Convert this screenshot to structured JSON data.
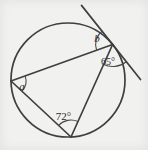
{
  "figure": {
    "labels": {
      "a": "a",
      "b": "b",
      "tangent_chord_angle": "65°",
      "inscribed_angle": "72°"
    },
    "colors": {
      "line": "#3f3f3f",
      "arc": "#4a4a4a",
      "text": "#2b2b2b",
      "background": "#f1f1ef"
    }
  }
}
